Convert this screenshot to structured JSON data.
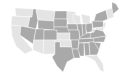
{
  "map": {
    "title": "United States",
    "legend": [],
    "colors": {
      "dark": "#a9a9a9",
      "light": "#e4e4e4",
      "border": "#ffffff"
    },
    "states": [
      {
        "id": "WA",
        "shade": "light",
        "pts": "15,8 33,9 32,17 16,16"
      },
      {
        "id": "OR",
        "shade": "light",
        "pts": "12,16 30,17 28,27 11,25"
      },
      {
        "id": "CA",
        "shade": "light",
        "pts": "11,25 21,26 20,35 33,50 25,54 16,46 12,36"
      },
      {
        "id": "ID",
        "shade": "dark",
        "pts": "33,9 36,9 38,20 36,29 28,27 30,17 32,17"
      },
      {
        "id": "NV",
        "shade": "dark",
        "pts": "21,26 36,29 33,44 20,35"
      },
      {
        "id": "MT",
        "shade": "light",
        "pts": "36,9 55,11 54,21 38,20"
      },
      {
        "id": "WY",
        "shade": "dark",
        "pts": "38,20 54,21 54,30 38,29"
      },
      {
        "id": "UT",
        "shade": "dark",
        "pts": "36,29 44,29 44,40 34,40"
      },
      {
        "id": "AZ",
        "shade": "light",
        "pts": "34,40 44,40 43,54 33,50 33,44"
      },
      {
        "id": "CO",
        "shade": "dark",
        "pts": "44,30 57,30 57,40 44,40"
      },
      {
        "id": "NM",
        "shade": "light",
        "pts": "44,40 55,40 55,54 43,54"
      },
      {
        "id": "ND",
        "shade": "dark",
        "pts": "55,11 67,11 67,19 54,19"
      },
      {
        "id": "SD",
        "shade": "dark",
        "pts": "54,19 67,19 67,27 54,27"
      },
      {
        "id": "NE",
        "shade": "dark",
        "pts": "54,27 68,27 70,33 57,33 57,30 54,30"
      },
      {
        "id": "KS",
        "shade": "light",
        "pts": "57,33 70,33 70,40 57,40"
      },
      {
        "id": "OK",
        "shade": "light",
        "pts": "55,40 71,40 72,47 60,47 60,42 55,42"
      },
      {
        "id": "TX",
        "shade": "dark",
        "pts": "55,42 60,42 60,47 72,47 74,58 67,62 63,72 57,66 52,57 55,54"
      },
      {
        "id": "MN",
        "shade": "light",
        "pts": "67,11 76,12 73,20 76,24 68,24 67,19"
      },
      {
        "id": "IA",
        "shade": "dark",
        "pts": "67,24 77,24 78,30 68,30"
      },
      {
        "id": "MO",
        "shade": "dark",
        "pts": "68,30 79,30 80,40 70,40 70,33"
      },
      {
        "id": "AR",
        "shade": "dark",
        "pts": "70,40 79,40 78,49 72,49 71,40"
      },
      {
        "id": "LA",
        "shade": "dark",
        "pts": "72,49 79,49 80,58 74,58"
      },
      {
        "id": "WI",
        "shade": "light",
        "pts": "73,14 80,16 81,24 76,24 73,20"
      },
      {
        "id": "IL",
        "shade": "dark",
        "pts": "77,24 82,24 83,36 80,40 79,30 78,30"
      },
      {
        "id": "MI",
        "shade": "light",
        "pts": "81,14 90,16 90,24 83,24"
      },
      {
        "id": "IN",
        "shade": "dark",
        "pts": "82,24 86,24 86,35 83,36"
      },
      {
        "id": "OH",
        "shade": "dark",
        "pts": "86,24 92,23 93,31 87,33 86,30"
      },
      {
        "id": "KY",
        "shade": "dark",
        "pts": "80,37 87,33 93,33 90,38 80,39"
      },
      {
        "id": "TN",
        "shade": "dark",
        "pts": "79,39 95,38 94,42 79,43"
      },
      {
        "id": "MS",
        "shade": "dark",
        "pts": "79,43 84,43 84,56 80,56 78,49"
      },
      {
        "id": "AL",
        "shade": "dark",
        "pts": "84,43 89,43 90,55 85,56"
      },
      {
        "id": "GA",
        "shade": "dark",
        "pts": "89,42 95,42 99,50 97,55 90,55"
      },
      {
        "id": "FL",
        "shade": "light",
        "pts": "85,56 97,55 103,64 104,72 100,70 95,61 90,58"
      },
      {
        "id": "SC",
        "shade": "dark",
        "pts": "94,42 101,43 99,50"
      },
      {
        "id": "NC",
        "shade": "dark",
        "pts": "93,38 106,36 104,42 94,42"
      },
      {
        "id": "VA",
        "shade": "dark",
        "pts": "91,33 96,29 103,31 106,36 93,38 90,38"
      },
      {
        "id": "WV",
        "shade": "light",
        "pts": "92,28 96,29 93,33 92,31"
      },
      {
        "id": "PA",
        "shade": "dark",
        "pts": "92,21 103,21 104,27 93,28"
      },
      {
        "id": "NY",
        "shade": "dark",
        "pts": "96,14 106,10 108,19 103,21 94,21"
      },
      {
        "id": "NJ",
        "shade": "light",
        "pts": "104,22 106,23 105,28 103,27"
      },
      {
        "id": "MD",
        "shade": "light",
        "pts": "96,28 104,27 103,31 96,29"
      },
      {
        "id": "NE_states",
        "shade": "light",
        "pts": "106,10 112,8 114,17 108,19"
      },
      {
        "id": "ME",
        "shade": "dark",
        "pts": "112,2 116,4 119,9 113,14 112,8"
      }
    ]
  }
}
